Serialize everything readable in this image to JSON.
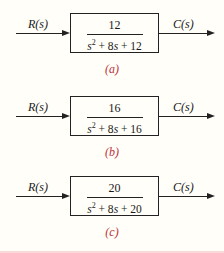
{
  "diagrams": [
    {
      "input": "R(s)",
      "output": "C(s)",
      "numerator": "12",
      "denominator": {
        "s2": "s",
        "exp": "2",
        "rest": " + 8",
        "s": "s",
        "const": " + 12"
      },
      "caption": "(a)"
    },
    {
      "input": "R(s)",
      "output": "C(s)",
      "numerator": "16",
      "denominator": {
        "s2": "s",
        "exp": "2",
        "rest": " + 8",
        "s": "s",
        "const": " + 16"
      },
      "caption": "(b)"
    },
    {
      "input": "R(s)",
      "output": "C(s)",
      "numerator": "20",
      "denominator": {
        "s2": "s",
        "exp": "2",
        "rest": " + 8",
        "s": "s",
        "const": " + 20"
      },
      "caption": "(c)"
    }
  ],
  "colors": {
    "line": "#222222",
    "caption": "#c0303a",
    "background": "#fffef8"
  }
}
